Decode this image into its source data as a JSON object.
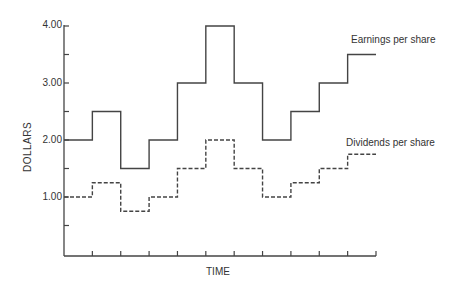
{
  "chart_data": {
    "type": "line",
    "step": true,
    "title": "",
    "xlabel": "TIME",
    "ylabel": "DOLLARS",
    "ylim": [
      0,
      4.0
    ],
    "y_ticks": [
      "1.00",
      "2.00",
      "3.00",
      "4.00"
    ],
    "x_periods": 11,
    "x": [
      1,
      2,
      3,
      4,
      5,
      6,
      7,
      8,
      9,
      10,
      11
    ],
    "grid": false,
    "series": [
      {
        "name": "Earnings per share",
        "style": "solid",
        "values": [
          2.0,
          2.5,
          1.5,
          2.0,
          3.0,
          4.0,
          3.0,
          2.0,
          2.5,
          3.0,
          3.5
        ]
      },
      {
        "name": "Dividends per share",
        "style": "dashed",
        "values": [
          1.0,
          1.25,
          0.75,
          1.0,
          1.5,
          2.0,
          1.5,
          1.0,
          1.25,
          1.5,
          1.75
        ]
      }
    ]
  },
  "labels": {
    "y_ticks": [
      "4.00",
      "3.00",
      "2.00",
      "1.00"
    ],
    "ylabel": "DOLLARS",
    "xlabel": "TIME",
    "legend_earnings": "Earnings per share",
    "legend_dividends": "Dividends per share"
  }
}
